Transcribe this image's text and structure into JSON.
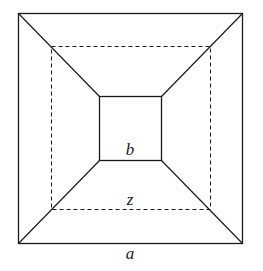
{
  "diagram": {
    "labels": {
      "inner": "b",
      "middle": "z",
      "outer": "a"
    },
    "colors": {
      "stroke": "#1a1a1a",
      "background": "#ffffff"
    },
    "geometry": {
      "outer_square": [
        18,
        13,
        242,
        243
      ],
      "middle_square_dashed": [
        51,
        46,
        210,
        209
      ],
      "inner_square": [
        99,
        96,
        161,
        160
      ]
    }
  }
}
